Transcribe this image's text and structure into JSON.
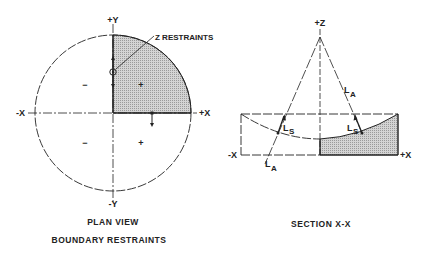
{
  "plan_view": {
    "axis_labels": {
      "pos_y": "+Y",
      "neg_y": "-Y",
      "pos_x": "+X",
      "neg_x": "-X"
    },
    "callout": "Z RESTRAINTS",
    "quadrant_signs": {
      "upper_left": "−",
      "upper_right": "+",
      "lower_left": "−",
      "lower_right": "+"
    },
    "caption_line1": "PLAN VIEW",
    "caption_line2": "BOUNDARY RESTRAINTS"
  },
  "section_view": {
    "axis_labels": {
      "pos_z": "+Z",
      "pos_x": "+X",
      "neg_x": "-X"
    },
    "labels": {
      "la_main": "L",
      "la_sub": "A",
      "ls_main": "L",
      "ls_sub": "S"
    },
    "caption": "SECTION X-X"
  },
  "colors": {
    "ink": "#222222",
    "hatch": "#b8b8b8",
    "background": "#ffffff"
  }
}
